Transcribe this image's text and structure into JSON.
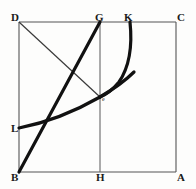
{
  "figure": {
    "canvas": {
      "width": 196,
      "height": 189
    },
    "colors": {
      "background": "#fdfdfc",
      "thin_stroke": "#555555",
      "thick_stroke": "#111111",
      "label": "#1a1a1a"
    },
    "square": {
      "name": "square-DCAB",
      "corners": {
        "D": {
          "x": 19,
          "y": 22
        },
        "C": {
          "x": 176,
          "y": 22
        },
        "A": {
          "x": 176,
          "y": 172
        },
        "B": {
          "x": 19,
          "y": 172
        }
      }
    },
    "points": {
      "D": {
        "x": 19,
        "y": 22
      },
      "G": {
        "x": 100,
        "y": 22
      },
      "K": {
        "x": 130,
        "y": 22
      },
      "C": {
        "x": 176,
        "y": 22
      },
      "L": {
        "x": 19,
        "y": 128
      },
      "E": {
        "x": 100,
        "y": 97
      },
      "B": {
        "x": 19,
        "y": 172
      },
      "H": {
        "x": 100,
        "y": 172
      },
      "A": {
        "x": 176,
        "y": 172
      }
    },
    "labels": [
      {
        "id": "label-D",
        "text": "D",
        "x": 11,
        "y": 12
      },
      {
        "id": "label-G",
        "text": "G",
        "x": 95,
        "y": 12
      },
      {
        "id": "label-K",
        "text": "K",
        "x": 124,
        "y": 12
      },
      {
        "id": "label-C",
        "text": "C",
        "x": 177,
        "y": 12
      },
      {
        "id": "label-L",
        "text": "L",
        "x": 11,
        "y": 123
      },
      {
        "id": "label-B",
        "text": "B",
        "x": 11,
        "y": 172
      },
      {
        "id": "label-H",
        "text": "H",
        "x": 96,
        "y": 172
      },
      {
        "id": "label-A",
        "text": "A",
        "x": 177,
        "y": 172
      },
      {
        "id": "label-E",
        "text": "e",
        "x": 102,
        "y": 96
      }
    ],
    "segments": [
      {
        "id": "side-DC",
        "from": "D",
        "to": "C",
        "weight": "thin"
      },
      {
        "id": "side-CA",
        "from": "C",
        "to": "A",
        "weight": "thin"
      },
      {
        "id": "side-AB",
        "from": "A",
        "to": "B",
        "weight": "thin"
      },
      {
        "id": "side-BD",
        "from": "B",
        "to": "D",
        "weight": "thin"
      },
      {
        "id": "line-GH",
        "from": "G",
        "to": "H",
        "weight": "thin"
      },
      {
        "id": "line-BG",
        "from": "B",
        "to": "G",
        "weight": "thick"
      },
      {
        "id": "line-DE",
        "from": "D",
        "to": "E",
        "weight": "thin"
      }
    ],
    "curves": [
      {
        "id": "curve-LE",
        "description": "concave-up arc from L on side BD rising through E toward K region",
        "path": "M 19 128 Q 60 120 100 97 Q 122 84 134 72",
        "weight": "thick"
      },
      {
        "id": "curve-KE",
        "description": "arc from K on side DC descending and curving left to E",
        "path": "M 130 22 Q 134 60 119 82 Q 110 93 100 97",
        "weight": "thick"
      }
    ]
  }
}
